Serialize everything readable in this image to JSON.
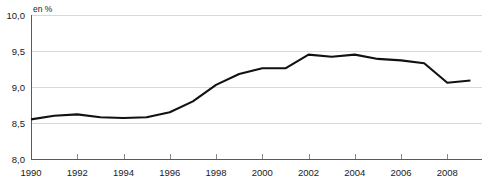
{
  "chart_data": {
    "type": "line",
    "title": "",
    "subtitle": "",
    "xlabel": "",
    "ylabel": "",
    "unit_label": "en %",
    "grid": true,
    "legend": null,
    "xlim": [
      1990,
      2009.5
    ],
    "ylim": [
      8.0,
      10.0
    ],
    "x_tick_labels": [
      "1990",
      "1992",
      "1994",
      "1996",
      "1998",
      "2000",
      "2002",
      "2004",
      "2006",
      "2008"
    ],
    "x_tick_values": [
      1990,
      1992,
      1994,
      1996,
      1998,
      2000,
      2002,
      2004,
      2006,
      2008
    ],
    "y_tick_labels": [
      "10,0",
      "9,5",
      "9,0",
      "8,5",
      "8,0"
    ],
    "y_tick_values": [
      10.0,
      9.5,
      9.0,
      8.5,
      8.0
    ],
    "x": [
      1990,
      1991,
      1992,
      1993,
      1994,
      1995,
      1996,
      1997,
      1998,
      1999,
      2000,
      2001,
      2002,
      2003,
      2004,
      2005,
      2006,
      2007,
      2008,
      2009
    ],
    "values": [
      8.55,
      8.6,
      8.62,
      8.58,
      8.57,
      8.58,
      8.65,
      8.8,
      9.03,
      9.18,
      9.26,
      9.26,
      9.45,
      9.42,
      9.45,
      9.39,
      9.37,
      9.33,
      9.06,
      9.09
    ],
    "series": [
      {
        "name": "",
        "color": "#111111",
        "values": [
          8.55,
          8.6,
          8.62,
          8.58,
          8.57,
          8.58,
          8.65,
          8.8,
          9.03,
          9.18,
          9.26,
          9.26,
          9.45,
          9.42,
          9.45,
          9.39,
          9.37,
          9.33,
          9.06,
          9.09
        ]
      }
    ]
  },
  "colors": {
    "line": "#111111",
    "grid": "#d9d9d9",
    "axis": "#5a5a5a",
    "text": "#1a1a1a",
    "background": "#ffffff"
  }
}
